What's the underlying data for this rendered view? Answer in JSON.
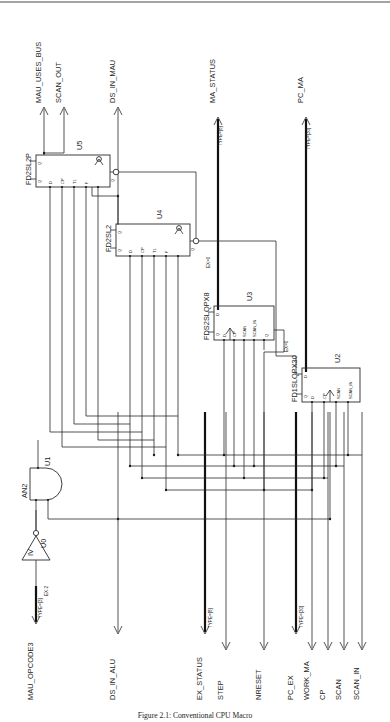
{
  "figure": {
    "caption": "Figure 2.1: Conventional CPU Macro"
  },
  "outputs": [
    {
      "name": "MAU_USES_BUS",
      "type": ""
    },
    {
      "name": "SCAN_OUT",
      "type": ""
    },
    {
      "name": "DS_IN_MAU",
      "type": ""
    },
    {
      "name": "MA_STATUS",
      "type": "TYPE=[8]"
    },
    {
      "name": "PC_MA",
      "type": "TYPE=[30]"
    }
  ],
  "inputs": [
    {
      "name": "MAU_OPCODE3",
      "type": "TYPE=[3]",
      "note": "EX:2"
    },
    {
      "name": "DS_IN_ALU",
      "type": ""
    },
    {
      "name": "EX_STATUS",
      "type": "TYPE=[8]"
    },
    {
      "name": "STEP",
      "type": ""
    },
    {
      "name": "NRESET",
      "type": ""
    },
    {
      "name": "PC_EX",
      "type": "TYPE=[30]"
    },
    {
      "name": "WORK_MA",
      "type": ""
    },
    {
      "name": "CP",
      "type": ""
    },
    {
      "name": "SCAN",
      "type": ""
    },
    {
      "name": "SCAN_IN",
      "type": ""
    }
  ],
  "instances": [
    {
      "ref": "U5",
      "cell": "FD2SL2P",
      "pins_bottom": [
        "D",
        "CP",
        "T1",
        "F"
      ],
      "pins_left": [
        "Q",
        "Q"
      ],
      "pins_right": [
        "Q"
      ],
      "annotation": ""
    },
    {
      "ref": "U4",
      "cell": "FD2SL2",
      "pins_bottom": [
        "D",
        "CP",
        "T1",
        "F"
      ],
      "pins_left": [
        "Q",
        "Q"
      ],
      "pins_right": [
        "Q"
      ],
      "annotation": "EX=0"
    },
    {
      "ref": "U3",
      "cell": "FDS2SLQPX8",
      "pins_bottom": [
        "D",
        "CP",
        "SCAN",
        "SCAN_IN",
        "Q"
      ],
      "pins_left": [
        "D",
        "Q"
      ],
      "pins_right": [
        "Q"
      ],
      "annotation": "EX=0"
    },
    {
      "ref": "U2",
      "cell": "FD1SLQPX30",
      "pins_bottom": [
        "D",
        "CP",
        "SCAN",
        "SCAN_IN"
      ],
      "pins_left": [
        "D",
        "Q"
      ],
      "pins_right": [
        "Q"
      ],
      "annotation": ""
    },
    {
      "ref": "U1",
      "cell": "AN2",
      "pins_bottom": [
        "A",
        "B"
      ],
      "pins_left": [],
      "pins_right": [],
      "annotation": ""
    },
    {
      "ref": "U0",
      "cell": "IV",
      "pins_bottom": [
        "A"
      ],
      "pins_left": [],
      "pins_right": [],
      "annotation": ""
    }
  ]
}
